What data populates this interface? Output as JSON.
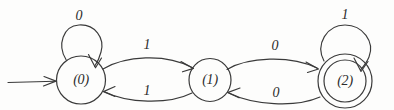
{
  "diagram": {
    "type": "finite-state-machine",
    "title": "",
    "background_color": "#fdfdfc",
    "ink_color": "#3a3a3a",
    "states": [
      {
        "id": "q0",
        "label": "(0)",
        "is_start": true,
        "is_accepting": false,
        "cx": 81,
        "cy": 80,
        "r": 24
      },
      {
        "id": "q1",
        "label": "(1)",
        "is_start": false,
        "is_accepting": false,
        "cx": 210,
        "cy": 80,
        "r": 21
      },
      {
        "id": "q2",
        "label": "(2)",
        "is_start": false,
        "is_accepting": true,
        "cx": 345,
        "cy": 81,
        "r": 27,
        "inner_r": 21
      }
    ],
    "transitions": [
      {
        "from": "q0",
        "to": "q0",
        "label": "0",
        "kind": "self-loop",
        "label_x": 79,
        "label_y": 17
      },
      {
        "from": "q0",
        "to": "q1",
        "label": "1",
        "kind": "arc-upper",
        "label_x": 147,
        "label_y": 46
      },
      {
        "from": "q1",
        "to": "q0",
        "label": "1",
        "kind": "arc-lower",
        "label_x": 147,
        "label_y": 92
      },
      {
        "from": "q1",
        "to": "q2",
        "label": "0",
        "kind": "arc-upper",
        "label_x": 275,
        "label_y": 47
      },
      {
        "from": "q2",
        "to": "q1",
        "label": "0",
        "kind": "arc-lower",
        "label_x": 276,
        "label_y": 94
      },
      {
        "from": "q2",
        "to": "q2",
        "label": "1",
        "kind": "self-loop",
        "label_x": 345,
        "label_y": 16
      }
    ],
    "start_arrow": {
      "label": "",
      "x1": 8,
      "y1": 82,
      "x2": 55,
      "y2": 81
    }
  }
}
